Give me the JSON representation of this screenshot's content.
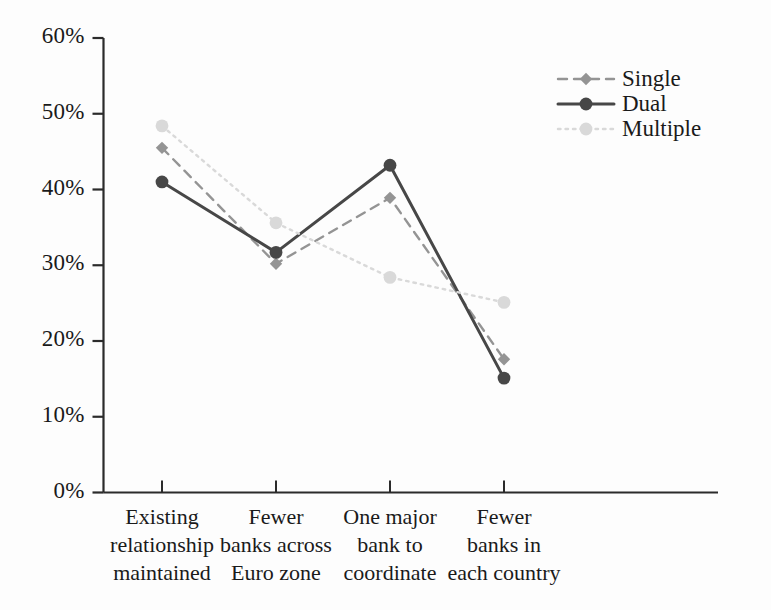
{
  "chart_data": {
    "type": "line",
    "title": "",
    "subtitle": "",
    "xlabel": "",
    "ylabel": "",
    "ylim": [
      0,
      60
    ],
    "yunit": "%",
    "grid": false,
    "legend_position": "top-right",
    "categories": [
      "Existing relationship maintained",
      "Fewer banks across Euro zone",
      "One major bank to coordinate",
      "Fewer banks in each country"
    ],
    "category_lines": [
      [
        "Existing",
        "relationship",
        "maintained"
      ],
      [
        "Fewer",
        "banks across",
        "Euro zone"
      ],
      [
        "One major",
        "bank to",
        "coordinate"
      ],
      [
        "Fewer",
        "banks in",
        "each country"
      ]
    ],
    "ytick_labels": [
      "0%",
      "10%",
      "20%",
      "30%",
      "40%",
      "50%",
      "60%"
    ],
    "ytick_values": [
      0,
      10,
      20,
      30,
      40,
      50,
      60
    ],
    "series": [
      {
        "name": "Single",
        "values": [
          45.5,
          30.2,
          38.9,
          17.6
        ],
        "color": "#949494",
        "line_style": "dashed",
        "marker": "diamond"
      },
      {
        "name": "Dual",
        "values": [
          41.0,
          31.7,
          43.2,
          15.1
        ],
        "color": "#474747",
        "line_style": "solid",
        "marker": "circle"
      },
      {
        "name": "Multiple",
        "values": [
          48.4,
          35.6,
          28.4,
          25.1
        ],
        "color": "#d9d9d9",
        "line_style": "dotted",
        "marker": "circle"
      }
    ]
  },
  "legend": {
    "items": [
      {
        "label": "Single"
      },
      {
        "label": "Dual"
      },
      {
        "label": "Multiple"
      }
    ]
  }
}
